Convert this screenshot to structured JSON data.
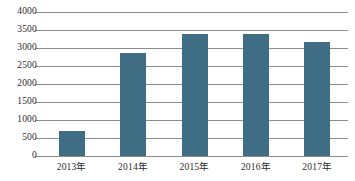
{
  "chart_data": {
    "type": "bar",
    "title": "",
    "subtitle": "",
    "xlabel": "",
    "ylabel": "",
    "categories": [
      "2013年",
      "2014年",
      "2015年",
      "2016年",
      "2017年"
    ],
    "values": [
      690,
      2860,
      3390,
      3400,
      3170
    ],
    "series": [
      {
        "name": "",
        "values": [
          690,
          2860,
          3390,
          3400,
          3170
        ]
      }
    ],
    "ylim": [
      0,
      4000
    ],
    "y_ticks": [
      0,
      500,
      1000,
      1500,
      2000,
      2500,
      3000,
      3500,
      4000
    ],
    "y_tick_labels": [
      "0",
      "500",
      "1000",
      "1500",
      "2000",
      "2500",
      "3000",
      "3500",
      "4000"
    ],
    "grid": true,
    "legend": false,
    "legend_position": "none",
    "bar_color": "#3f6e84",
    "gridline_color": "#8d8d8d",
    "background_color": "#ffffff",
    "text_color": "#2b2b2b"
  }
}
